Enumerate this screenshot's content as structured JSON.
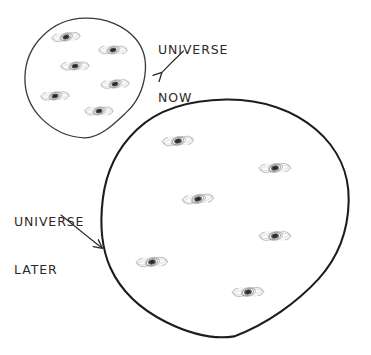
{
  "diagram": {
    "background_color": "#ffffff",
    "ink_color": "#2b2b2b",
    "labels": [
      {
        "name": "universe-now",
        "line1": "UNIVERSE",
        "line2": "NOW",
        "arrow": "arrow-down-left"
      },
      {
        "name": "universe-later",
        "line1": "UNIVERSE",
        "line2": "LATER",
        "arrow": "arrow-down-right"
      }
    ],
    "circles": [
      {
        "name": "universe-now-circle",
        "cx": 85,
        "cy": 78,
        "r": 60,
        "stroke_width": 1.3,
        "stroke": "#3a3a3a",
        "galaxy_count": 6
      },
      {
        "name": "universe-later-circle",
        "cx": 225,
        "cy": 219,
        "r": 124,
        "stroke_width": 2.1,
        "stroke": "#1d1d1d",
        "galaxy_count": 6
      }
    ],
    "galaxies_now": [
      {
        "cx": 66,
        "cy": 37,
        "scale": 0.82,
        "rotate": -18
      },
      {
        "cx": 113,
        "cy": 50,
        "scale": 0.82,
        "rotate": -12
      },
      {
        "cx": 75,
        "cy": 66,
        "scale": 0.82,
        "rotate": -14
      },
      {
        "cx": 115,
        "cy": 84,
        "scale": 0.82,
        "rotate": -16
      },
      {
        "cx": 55,
        "cy": 96,
        "scale": 0.82,
        "rotate": -15
      },
      {
        "cx": 99,
        "cy": 111,
        "scale": 0.82,
        "rotate": -13
      }
    ],
    "galaxies_later": [
      {
        "cx": 178,
        "cy": 141,
        "scale": 0.9,
        "rotate": -16
      },
      {
        "cx": 275,
        "cy": 168,
        "scale": 0.9,
        "rotate": -14
      },
      {
        "cx": 198,
        "cy": 199,
        "scale": 0.9,
        "rotate": -17
      },
      {
        "cx": 275,
        "cy": 236,
        "scale": 0.9,
        "rotate": -13
      },
      {
        "cx": 152,
        "cy": 262,
        "scale": 0.9,
        "rotate": -15
      },
      {
        "cx": 248,
        "cy": 292,
        "scale": 0.9,
        "rotate": -14
      }
    ],
    "arrows": [
      {
        "name": "arrow-to-universe-now",
        "x1": 182,
        "y1": 52,
        "x2": 160,
        "y2": 74
      },
      {
        "name": "arrow-to-universe-later",
        "x1": 62,
        "y1": 216,
        "x2": 104,
        "y2": 249
      }
    ]
  }
}
